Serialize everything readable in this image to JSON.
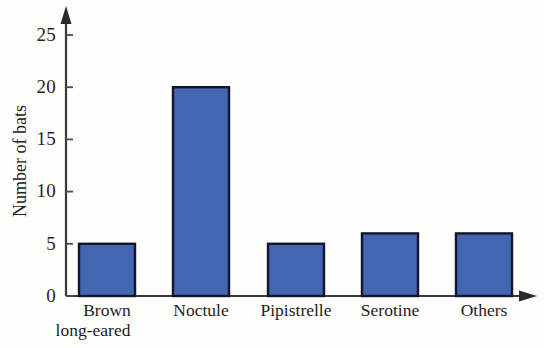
{
  "chart_data": {
    "type": "bar",
    "title": "",
    "xlabel": "",
    "ylabel": "Number of bats",
    "categories": [
      "Brown long-eared",
      "Noctule",
      "Pipistrelle",
      "Serotine",
      "Others"
    ],
    "category_lines": [
      [
        "Brown",
        "long-eared"
      ],
      [
        "Noctule"
      ],
      [
        "Pipistrelle"
      ],
      [
        "Serotine"
      ],
      [
        "Others"
      ]
    ],
    "values": [
      4,
      5,
      20,
      5,
      6
    ],
    "ylim": [
      0,
      27
    ],
    "yticks": [
      0,
      5,
      10,
      15,
      20,
      25
    ],
    "ytick_labels": [
      "0",
      "5",
      "10",
      "15",
      "20",
      "25"
    ],
    "grid": false,
    "legend": false,
    "bar_fill_color": "#4266B0",
    "bar_edge_color": "#11162c",
    "axis_color": "#3a3a3a",
    "background_color": "#fdfdfc",
    "axis_arrows": {
      "y": "up-arrow",
      "x": "right-arrow"
    }
  },
  "axis": {
    "y_title": "Number of bats"
  }
}
